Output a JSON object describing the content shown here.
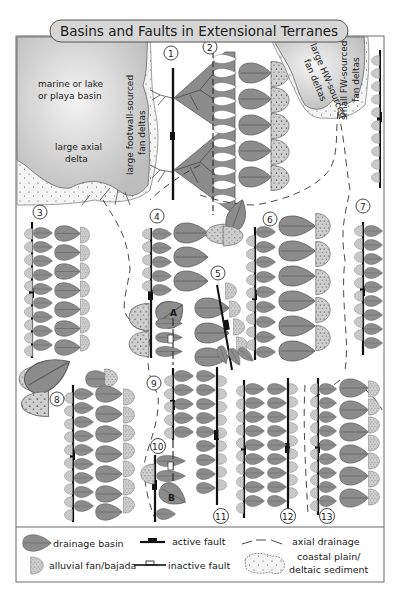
{
  "title": "Basins and Faults in Extensional Terranes",
  "colors": {
    "basin_fill": "#8c8c8c",
    "basin_stroke": "#5a5a5a",
    "fan_fill": "#cfcfcf",
    "water_fill": "#cdcdcd",
    "fault": "#111111",
    "frame": "#555555",
    "coastal": "#f2f2f2"
  },
  "map_labels": {
    "marine_basin_line1": "marine or lake",
    "marine_basin_line2": "or playa basin",
    "axial_delta_line1": "large axial",
    "axial_delta_line2": "delta",
    "fw_fan_deltas_line1": "large footwall-sourced",
    "fw_fan_deltas_line2": "fan deltas",
    "hw_fan_deltas_line1": "large HW-sourced",
    "hw_fan_deltas_line2": "fan deltas",
    "small_fw_line1": "small FW-sourced",
    "small_fw_line2": "fan deltas",
    "point_a": "A",
    "point_b": "B"
  },
  "settings": {
    "n1": "1",
    "n2": "2",
    "n3": "3",
    "n4": "4",
    "n5": "5",
    "n6": "6",
    "n7": "7",
    "n8": "8",
    "n9": "9",
    "n10": "10",
    "n11": "11",
    "n12": "12",
    "n13": "13"
  },
  "legend": {
    "drainage_basin": "drainage basin",
    "alluvial_fan": "alluvial fan/bajada",
    "active_fault": "active fault",
    "inactive_fault": "inactive fault",
    "axial_drainage": "axial drainage",
    "coastal_line1": "coastal plain/",
    "coastal_line2": "deltaic sediment"
  }
}
